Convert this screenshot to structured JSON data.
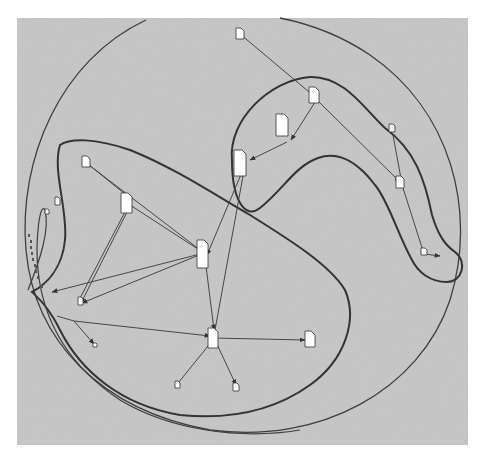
{
  "diagram": {
    "type": "network-graph-with-cluster-boundaries",
    "background_color": "#c8c8c8",
    "panel": {
      "x": 17,
      "y": 18,
      "width": 451,
      "height": 427
    },
    "line_color": "#4a4a4a",
    "boundary_color": "#3a3a3a",
    "node_fill": "#ffffff",
    "node_icon": "document-icon",
    "nodes": [
      {
        "id": "n1",
        "x": 237,
        "y": 30,
        "w": 7,
        "h": 9
      },
      {
        "id": "n2",
        "x": 313,
        "y": 93,
        "w": 9,
        "h": 12
      },
      {
        "id": "n3",
        "x": 283,
        "y": 134,
        "w": 12,
        "h": 20
      },
      {
        "id": "n4",
        "x": 241,
        "y": 151,
        "w": 12,
        "h": 25
      },
      {
        "id": "n5",
        "x": 391,
        "y": 131,
        "w": 5,
        "h": 8
      },
      {
        "id": "n6",
        "x": 398,
        "y": 177,
        "w": 7,
        "h": 12
      },
      {
        "id": "n7",
        "x": 424,
        "y": 252,
        "w": 6,
        "h": 6
      },
      {
        "id": "n8",
        "x": 85,
        "y": 160,
        "w": 7,
        "h": 10
      },
      {
        "id": "n9",
        "x": 124,
        "y": 194,
        "w": 10,
        "h": 19
      },
      {
        "id": "n10",
        "x": 199,
        "y": 240,
        "w": 11,
        "h": 27
      },
      {
        "id": "n11",
        "x": 57,
        "y": 199,
        "w": 5,
        "h": 8
      },
      {
        "id": "n12",
        "x": 47,
        "y": 211,
        "w": 4,
        "h": 4
      },
      {
        "id": "n13",
        "x": 79,
        "y": 298,
        "w": 4,
        "h": 8
      },
      {
        "id": "n14",
        "x": 210,
        "y": 329,
        "w": 9,
        "h": 20
      },
      {
        "id": "n15",
        "x": 306,
        "y": 333,
        "w": 9,
        "h": 14
      },
      {
        "id": "n16",
        "x": 177,
        "y": 381,
        "w": 4,
        "h": 7
      },
      {
        "id": "n17",
        "x": 234,
        "y": 383,
        "w": 6,
        "h": 8
      },
      {
        "id": "n18",
        "x": 94,
        "y": 343,
        "w": 4,
        "h": 4
      }
    ],
    "edges": [
      [
        "n1",
        "n2"
      ],
      [
        "n2",
        "n3"
      ],
      [
        "n3",
        "n4"
      ],
      [
        "n2",
        "n6"
      ],
      [
        "n5",
        "n6"
      ],
      [
        "n6",
        "n7"
      ],
      [
        "n8",
        "n9"
      ],
      [
        "n8",
        "n10"
      ],
      [
        "n9",
        "n10"
      ],
      [
        "n9",
        "n13"
      ],
      [
        "n10",
        "n13"
      ],
      [
        "n10",
        "hub_left"
      ],
      [
        "n4",
        "n10"
      ],
      [
        "n4",
        "n14"
      ],
      [
        "n10",
        "n14"
      ],
      [
        "n14",
        "n15"
      ],
      [
        "n14",
        "n16"
      ],
      [
        "n14",
        "n17"
      ],
      [
        "hub_mid",
        "n14"
      ],
      [
        "hub_mid",
        "n18"
      ],
      [
        "n9",
        "hub_left"
      ]
    ],
    "caption": ""
  }
}
